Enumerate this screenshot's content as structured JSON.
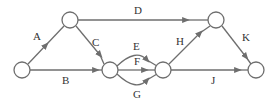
{
  "diagram": {
    "type": "activity-network",
    "nodes": [
      {
        "id": "n1",
        "x": 22,
        "y": 70,
        "r": 8
      },
      {
        "id": "n2",
        "x": 70,
        "y": 20,
        "r": 8
      },
      {
        "id": "n3",
        "x": 110,
        "y": 70,
        "r": 8
      },
      {
        "id": "n4",
        "x": 163,
        "y": 70,
        "r": 8
      },
      {
        "id": "n5",
        "x": 216,
        "y": 20,
        "r": 8
      },
      {
        "id": "n6",
        "x": 256,
        "y": 70,
        "r": 8
      }
    ],
    "edges": [
      {
        "label": "A",
        "from": "n1",
        "to": "n2"
      },
      {
        "label": "B",
        "from": "n1",
        "to": "n3"
      },
      {
        "label": "C",
        "from": "n2",
        "to": "n3"
      },
      {
        "label": "D",
        "from": "n2",
        "to": "n5"
      },
      {
        "label": "E",
        "from": "n3",
        "to": "n4"
      },
      {
        "label": "F",
        "from": "n3",
        "to": "n4"
      },
      {
        "label": "G",
        "from": "n3",
        "to": "n4"
      },
      {
        "label": "H",
        "from": "n4",
        "to": "n5"
      },
      {
        "label": "J",
        "from": "n4",
        "to": "n6"
      },
      {
        "label": "K",
        "from": "n5",
        "to": "n6"
      }
    ]
  },
  "labels": {
    "A": "A",
    "B": "B",
    "C": "C",
    "D": "D",
    "E": "E",
    "F": "F",
    "G": "G",
    "H": "H",
    "J": "J",
    "K": "K"
  }
}
